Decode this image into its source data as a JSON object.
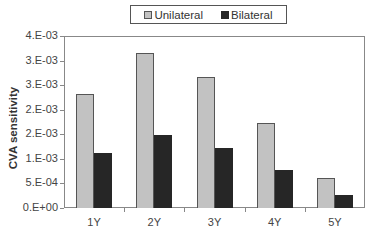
{
  "chart_data": {
    "type": "bar",
    "title": "",
    "xlabel": "",
    "ylabel": "CVA sensitivity",
    "categories": [
      "1Y",
      "2Y",
      "3Y",
      "4Y",
      "5Y"
    ],
    "series": [
      {
        "name": "Unilateral",
        "color": "#c2c2c2",
        "border": "#555555",
        "values": [
          0.00231,
          0.00315,
          0.00267,
          0.00173,
          0.00062
        ]
      },
      {
        "name": "Bilateral",
        "color": "#262626",
        "border": "#262626",
        "values": [
          0.00112,
          0.00149,
          0.00122,
          0.00077,
          0.00026
        ]
      }
    ],
    "ylim": [
      0,
      0.0035
    ],
    "yticks": [
      {
        "value": 0,
        "label": "0.E+00"
      },
      {
        "value": 0.0005,
        "label": "5.E-04"
      },
      {
        "value": 0.001,
        "label": "1.E-03"
      },
      {
        "value": 0.0015,
        "label": "2.E-03"
      },
      {
        "value": 0.002,
        "label": "2.E-03"
      },
      {
        "value": 0.0025,
        "label": "3.E-03"
      },
      {
        "value": 0.003,
        "label": "3.E-03"
      },
      {
        "value": 0.0035,
        "label": "4.E-03"
      }
    ],
    "grid": false,
    "legend_position": "top"
  },
  "legend": {
    "items": [
      {
        "label": "Unilateral"
      },
      {
        "label": "Bilateral"
      }
    ]
  },
  "axis": {
    "ylabel": "CVA sensitivity"
  }
}
